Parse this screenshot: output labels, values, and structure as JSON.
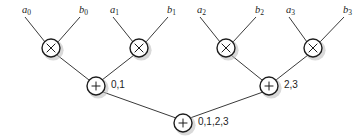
{
  "diagram": {
    "type": "butterfly-adder-tree",
    "canvas": {
      "width": 364,
      "height": 139,
      "background": "#ffffff"
    },
    "style": {
      "edge_color": "#3a3a3a",
      "node_fill": "#ffffff",
      "node_stroke": "#1d1d1d",
      "shadow_color": "#b9b9b9"
    },
    "inputs": [
      {
        "id": "a0",
        "base": "a",
        "sub": "0",
        "x": 22,
        "y": 5
      },
      {
        "id": "b0",
        "base": "b",
        "sub": "0",
        "x": 79,
        "y": 5
      },
      {
        "id": "a1",
        "base": "a",
        "sub": "1",
        "x": 110,
        "y": 5
      },
      {
        "id": "b1",
        "base": "b",
        "sub": "1",
        "x": 167,
        "y": 5
      },
      {
        "id": "a2",
        "base": "a",
        "sub": "2",
        "x": 197,
        "y": 5
      },
      {
        "id": "b2",
        "base": "b",
        "sub": "2",
        "x": 255,
        "y": 5
      },
      {
        "id": "a3",
        "base": "a",
        "sub": "3",
        "x": 286,
        "y": 5
      },
      {
        "id": "b3",
        "base": "b",
        "sub": "3",
        "x": 343,
        "y": 5
      }
    ],
    "multiply_nodes": [
      {
        "id": "mul0",
        "glyph": "multiply",
        "cx": 51,
        "cy": 48,
        "r": 9
      },
      {
        "id": "mul1",
        "glyph": "multiply",
        "cx": 139,
        "cy": 48,
        "r": 9
      },
      {
        "id": "mul2",
        "glyph": "multiply",
        "cx": 226,
        "cy": 48,
        "r": 9
      },
      {
        "id": "mul3",
        "glyph": "multiply",
        "cx": 313,
        "cy": 48,
        "r": 9
      }
    ],
    "add_nodes": [
      {
        "id": "add01",
        "glyph": "plus",
        "cx": 96,
        "cy": 86,
        "r": 9,
        "label": "0,1",
        "label_x": 111,
        "label_y": 80
      },
      {
        "id": "add23",
        "glyph": "plus",
        "cx": 269,
        "cy": 86,
        "r": 9,
        "label": "2,3",
        "label_x": 284,
        "label_y": 80
      },
      {
        "id": "add0123",
        "glyph": "plus",
        "cx": 183,
        "cy": 123,
        "r": 9,
        "label": "0,1,2,3",
        "label_x": 198,
        "label_y": 117
      }
    ],
    "edges": [
      {
        "from": "a0",
        "to": "mul0",
        "x1": 25,
        "y1": 17,
        "x2": 45,
        "y2": 42
      },
      {
        "from": "b0",
        "to": "mul0",
        "x1": 80,
        "y1": 17,
        "x2": 58,
        "y2": 42
      },
      {
        "from": "a1",
        "to": "mul1",
        "x1": 113,
        "y1": 17,
        "x2": 133,
        "y2": 42
      },
      {
        "from": "b1",
        "to": "mul1",
        "x1": 168,
        "y1": 17,
        "x2": 146,
        "y2": 42
      },
      {
        "from": "a2",
        "to": "mul2",
        "x1": 200,
        "y1": 17,
        "x2": 220,
        "y2": 42
      },
      {
        "from": "b2",
        "to": "mul2",
        "x1": 256,
        "y1": 17,
        "x2": 233,
        "y2": 42
      },
      {
        "from": "a3",
        "to": "mul3",
        "x1": 289,
        "y1": 17,
        "x2": 307,
        "y2": 42
      },
      {
        "from": "b3",
        "to": "mul3",
        "x1": 344,
        "y1": 17,
        "x2": 320,
        "y2": 42
      },
      {
        "from": "mul0",
        "to": "add01",
        "x1": 57,
        "y1": 55,
        "x2": 89,
        "y2": 80
      },
      {
        "from": "mul1",
        "to": "add01",
        "x1": 134,
        "y1": 55,
        "x2": 102,
        "y2": 80
      },
      {
        "from": "mul2",
        "to": "add23",
        "x1": 231,
        "y1": 55,
        "x2": 262,
        "y2": 80
      },
      {
        "from": "mul3",
        "to": "add23",
        "x1": 308,
        "y1": 55,
        "x2": 276,
        "y2": 80
      },
      {
        "from": "add01",
        "to": "add0123",
        "x1": 103,
        "y1": 92,
        "x2": 176,
        "y2": 118
      },
      {
        "from": "add23",
        "to": "add0123",
        "x1": 263,
        "y1": 92,
        "x2": 190,
        "y2": 118
      }
    ]
  }
}
